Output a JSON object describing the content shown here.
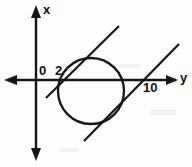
{
  "figure": {
    "background_color": "#fdfdfd",
    "ink_color": "#161616",
    "axes": {
      "vertical_axis_label": "x",
      "horizontal_axis_label": "y",
      "origin_label": "0",
      "vertical_axis_direction": "up",
      "horizontal_axis_direction": "right"
    },
    "tick_labels": [
      {
        "text": "0",
        "axis": "origin",
        "position": "above-left-of-origin"
      },
      {
        "text": "2",
        "axis": "y",
        "value": 2,
        "position": "above-axis"
      },
      {
        "text": "10",
        "axis": "y",
        "value": 10,
        "position": "below-axis"
      }
    ],
    "shapes": [
      {
        "kind": "circle",
        "name": "tangent-circle",
        "center_px": [
          91,
          91
        ],
        "radius_px": 33
      },
      {
        "kind": "line",
        "name": "upper-left-tangent-line",
        "from_px": [
          46,
          98
        ],
        "to_px": [
          119,
          26
        ]
      },
      {
        "kind": "line",
        "name": "lower-right-tangent-line",
        "from_px": [
          84,
          141
        ],
        "to_px": [
          179,
          44
        ]
      }
    ]
  }
}
